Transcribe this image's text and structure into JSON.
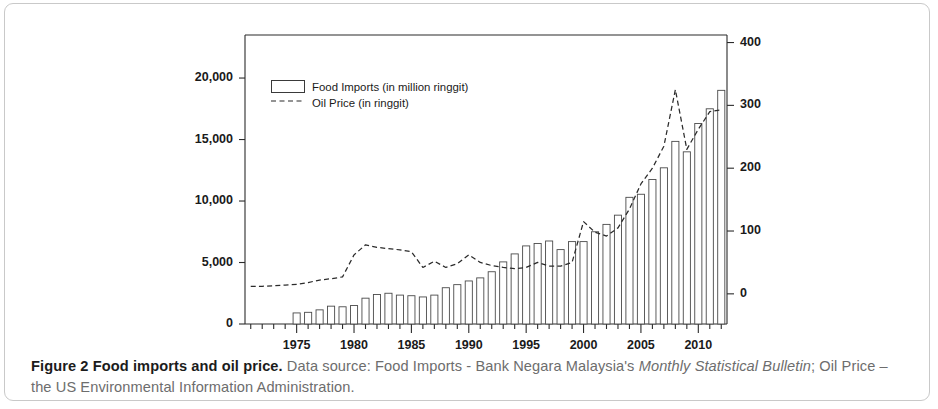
{
  "figure": {
    "caption_bold": "Figure 2 Food imports and oil price.",
    "caption_rest_1": " Data source: Food Imports - Bank Negara Malaysia's ",
    "caption_italic_1": "Monthly Statistical Bulletin",
    "caption_rest_2": "; Oil Price – the US Environmental Information Administration."
  },
  "chart_data": {
    "type": "bar",
    "title": "",
    "subtitle": "",
    "xlabel": "",
    "ylabel": "",
    "grid": false,
    "legend_position": "top-left",
    "x": [
      1971,
      1972,
      1973,
      1974,
      1975,
      1976,
      1977,
      1978,
      1979,
      1980,
      1981,
      1982,
      1983,
      1984,
      1985,
      1986,
      1987,
      1988,
      1989,
      1990,
      1991,
      1992,
      1993,
      1994,
      1995,
      1996,
      1997,
      1998,
      1999,
      2000,
      2001,
      2002,
      2003,
      2004,
      2005,
      2006,
      2007,
      2008,
      2009,
      2010,
      2011,
      2012
    ],
    "xtick_labels": [
      "1975",
      "1980",
      "1985",
      "1990",
      "1995",
      "2000",
      "2005",
      "2010"
    ],
    "xticks": [
      1975,
      1980,
      1985,
      1990,
      1995,
      2000,
      2005,
      2010
    ],
    "xlim": [
      1970.4,
      1912.6
    ],
    "left_axis": {
      "label": "Food Imports (in million ringgit)",
      "ylim": [
        0,
        23500
      ],
      "tick_labels": [
        "0",
        "5,000",
        "10,000",
        "15,000",
        "20,000"
      ],
      "ticks": [
        0,
        5000,
        10000,
        15000,
        20000
      ]
    },
    "right_axis": {
      "label": "Oil Price (in ringgit)",
      "ylim": [
        -48,
        412
      ],
      "tick_labels": [
        "0",
        "100",
        "200",
        "300",
        "400"
      ],
      "ticks": [
        0,
        100,
        200,
        300,
        400
      ]
    },
    "series": [
      {
        "name": "Food Imports (in million ringgit)",
        "type": "bar",
        "axis": "left",
        "unit": "million ringgit",
        "values": [
          null,
          null,
          null,
          null,
          900,
          950,
          1150,
          1450,
          1400,
          1500,
          2100,
          2400,
          2500,
          2350,
          2300,
          2200,
          2350,
          2950,
          3200,
          3500,
          3750,
          4250,
          5050,
          5700,
          6350,
          6550,
          6750,
          6050,
          6700,
          6700,
          7500,
          8100,
          8850,
          10300,
          10550,
          11750,
          12700,
          14850,
          14000,
          16300,
          17500,
          19000
        ]
      },
      {
        "name": "Oil Price (in ringgit)",
        "type": "line",
        "style": "dashed",
        "axis": "right",
        "unit": "ringgit",
        "values": [
          10,
          10,
          10,
          11,
          11,
          13,
          16,
          17,
          20,
          36,
          47,
          43,
          41,
          40,
          38,
          26,
          31,
          26,
          29,
          36,
          30,
          28,
          26,
          25,
          26,
          30,
          28,
          28,
          30,
          45,
          51,
          46,
          55,
          70,
          95,
          110,
          130,
          170,
          118,
          145,
          175,
          185
        ],
        "note": "right-axis scaled values (approx.)",
        "values_right_axis": [
          12,
          12,
          13,
          14,
          15,
          18,
          22,
          24,
          27,
          62,
          78,
          74,
          72,
          70,
          67,
          42,
          52,
          42,
          48,
          62,
          50,
          45,
          42,
          40,
          42,
          50,
          44,
          44,
          50,
          115,
          98,
          92,
          105,
          135,
          175,
          200,
          235,
          325,
          230,
          262,
          290,
          293
        ]
      }
    ]
  }
}
